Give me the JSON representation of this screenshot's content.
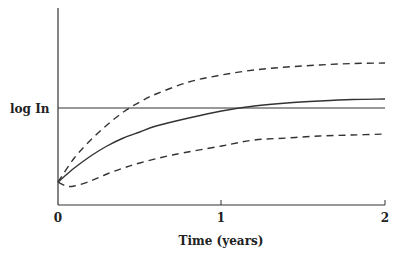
{
  "chart_data": {
    "type": "line",
    "title": "",
    "xlabel": "Time (years)",
    "ylabel": "",
    "xlim": [
      0,
      2
    ],
    "x_ticks": [
      0,
      1,
      2
    ],
    "x_tick_labels": [
      "0",
      "1",
      "2"
    ],
    "y_ticks": [],
    "grid": false,
    "legend": null,
    "reference_lines": [
      {
        "name": "log In",
        "label": "log In",
        "style": "solid-thin",
        "y_px": 108
      }
    ],
    "series": [
      {
        "name": "upper-bound",
        "style": "dashed",
        "x": [
          0,
          0.1,
          0.2,
          0.3,
          0.4,
          0.5,
          0.6,
          0.8,
          1.0,
          1.2,
          1.4,
          1.6,
          1.8,
          2.0
        ],
        "y_px": [
          182,
          158,
          140,
          125,
          112,
          102,
          94,
          82,
          75,
          70,
          67,
          65,
          63.5,
          63
        ]
      },
      {
        "name": "mean",
        "style": "solid",
        "x": [
          0,
          0.1,
          0.2,
          0.3,
          0.4,
          0.5,
          0.6,
          0.8,
          1.0,
          1.2,
          1.4,
          1.6,
          1.8,
          2.0
        ],
        "y_px": [
          182,
          168,
          156,
          146,
          138,
          132,
          126,
          118,
          111,
          106,
          103,
          101,
          99.5,
          99
        ]
      },
      {
        "name": "lower-bound",
        "style": "dashed",
        "x": [
          0,
          0.05,
          0.1,
          0.2,
          0.3,
          0.4,
          0.5,
          0.7,
          1.0,
          1.2,
          1.4,
          1.6,
          1.8,
          2.0
        ],
        "y_px": [
          182,
          186,
          186,
          181,
          174,
          168,
          163,
          155,
          146,
          140,
          138,
          136,
          135,
          134
        ]
      }
    ],
    "annotations": [
      "log In"
    ]
  },
  "axes": {
    "y_label": "log In",
    "x_label": "Time (years)",
    "x_ticks": [
      "0",
      "1",
      "2"
    ]
  }
}
